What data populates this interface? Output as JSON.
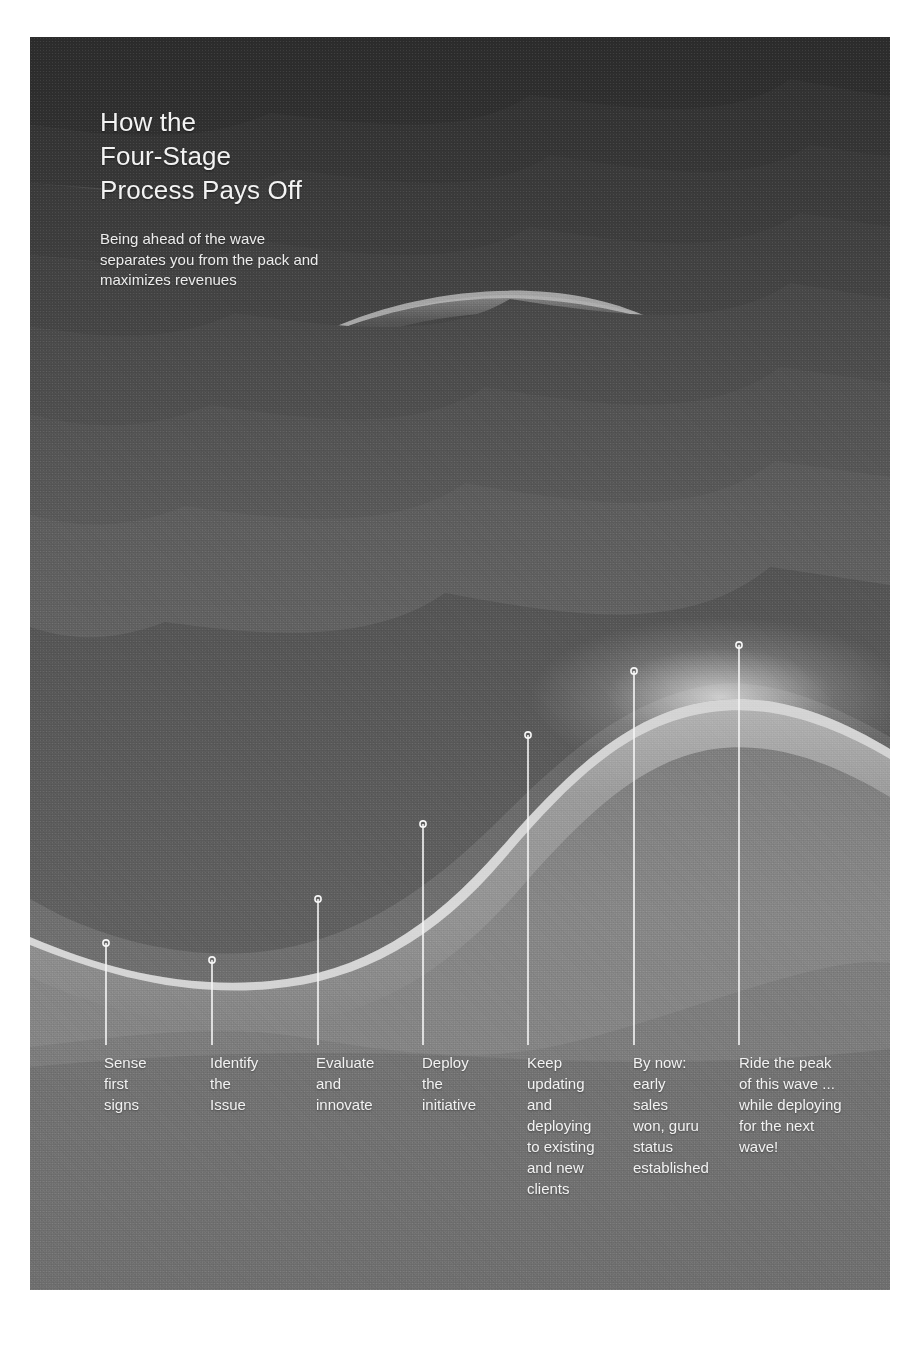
{
  "poster": {
    "headline": "How the\nFour-Stage\nProcess Pays Off",
    "subhead": "Being ahead of the wave separates you from the pack and maximizes revenues",
    "background_color": "#6e6e6e",
    "text_color": "#f2f2f2",
    "accent_color": "#f5f5f5"
  },
  "chart_data": {
    "type": "area",
    "title": "How the Four-Stage Process Pays Off",
    "subtitle": "Being ahead of the wave separates you from the pack and maximizes revenues",
    "xlabel": "",
    "ylabel": "",
    "grid": false,
    "legend": "none",
    "annotation_style": "leader-line-with-open-circle-marker",
    "categories": [
      "Sense first signs",
      "Identify the Issue",
      "Evaluate and innovate",
      "Deploy the initiative",
      "Keep updating and deploying to existing and new clients",
      "By now: early sales won, guru status established",
      "Ride the peak of this wave ... while deploying for the next wave!"
    ],
    "markers": [
      {
        "label": "Sense first signs",
        "x": 106,
        "y": 943
      },
      {
        "label": "Identify the Issue",
        "x": 212,
        "y": 960
      },
      {
        "label": "Evaluate and innovate",
        "x": 318,
        "y": 899
      },
      {
        "label": "Deploy the initiative",
        "x": 423,
        "y": 824
      },
      {
        "label": "Keep updating and deploying to existing and new clients",
        "x": 528,
        "y": 735
      },
      {
        "label": "By now: early sales won, guru status established",
        "x": 634,
        "y": 671
      },
      {
        "label": "Ride the peak of this wave ... while deploying for the next wave!",
        "x": 739,
        "y": 645
      }
    ]
  },
  "stages": [
    {
      "id": "stage-1",
      "text": "Sense\nfirst\nsigns",
      "x": 104,
      "marker_x": 106,
      "marker_y": 943,
      "line_bottom": 1045
    },
    {
      "id": "stage-2",
      "text": "Identify\nthe\nIssue",
      "x": 210,
      "marker_x": 212,
      "marker_y": 960,
      "line_bottom": 1045
    },
    {
      "id": "stage-3",
      "text": "Evaluate\nand\ninnovate",
      "x": 316,
      "marker_x": 318,
      "marker_y": 899,
      "line_bottom": 1045
    },
    {
      "id": "stage-4",
      "text": "Deploy\nthe\ninitiative",
      "x": 422,
      "marker_x": 423,
      "marker_y": 824,
      "line_bottom": 1045
    },
    {
      "id": "stage-5",
      "text": "Keep\nupdating\nand\ndeploying\nto existing\nand new\nclients",
      "x": 527,
      "marker_x": 528,
      "marker_y": 735,
      "line_bottom": 1045
    },
    {
      "id": "stage-6",
      "text": "By now:\nearly\nsales\nwon, guru\nstatus\nestablished",
      "x": 633,
      "marker_x": 634,
      "marker_y": 671,
      "line_bottom": 1045
    },
    {
      "id": "stage-7",
      "text": "Ride the peak\nof this wave ...\nwhile deploying\nfor the next\nwave!",
      "x": 739,
      "marker_x": 739,
      "marker_y": 645,
      "line_bottom": 1045
    }
  ]
}
